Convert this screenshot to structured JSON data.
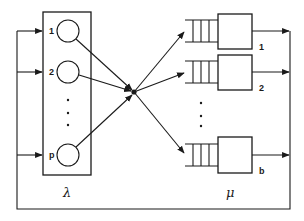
{
  "diagram": {
    "type": "queueing-network",
    "sources": {
      "label": "λ",
      "items": [
        {
          "label": "1"
        },
        {
          "label": "2"
        },
        {
          "label": "p"
        }
      ],
      "ellipsis": "⋮"
    },
    "servers": {
      "label": "μ",
      "items": [
        {
          "label": "1"
        },
        {
          "label": "2"
        },
        {
          "label": "b"
        }
      ],
      "ellipsis": "⋮"
    },
    "colors": {
      "stroke": "#1a1a1a",
      "background": "#ffffff"
    }
  }
}
